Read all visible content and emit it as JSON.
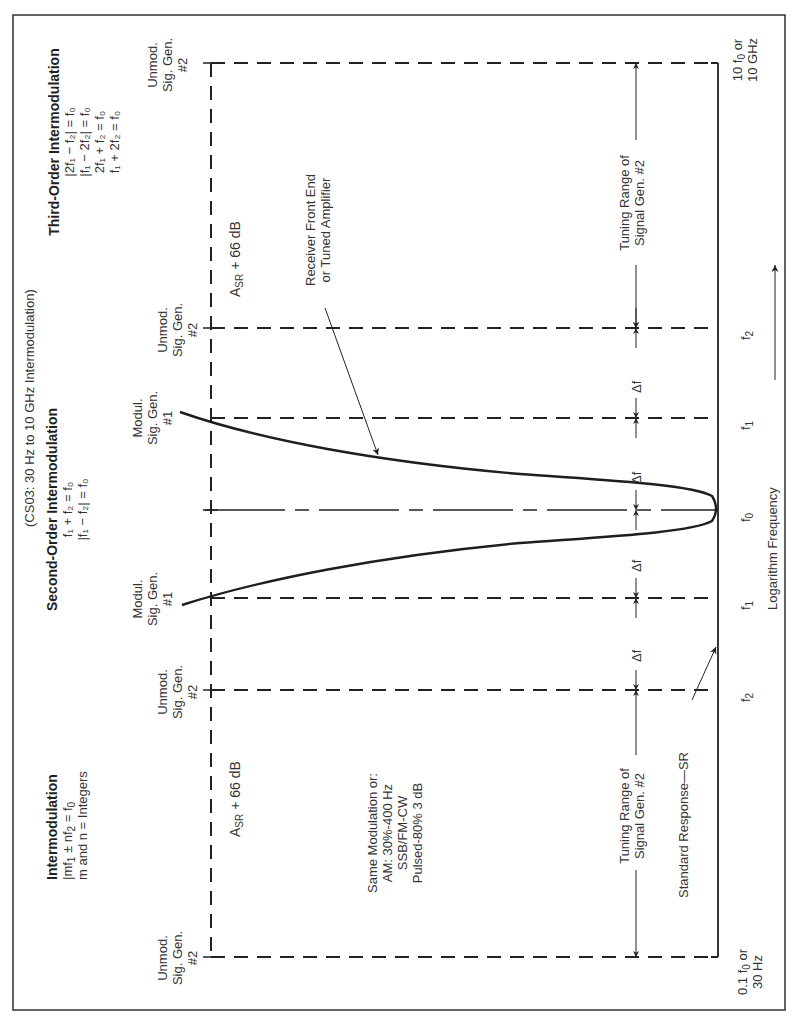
{
  "diagram": {
    "subtitle": "(CS03: 30 Hz to 10 GHz Intermodulation)",
    "intermod": {
      "title": "Intermodulation",
      "eq1": "|mf",
      "eq1_sub1": "1",
      "eq1_mid": " ± nf",
      "eq1_sub2": "2",
      "eq1_end": " = f",
      "eq1_sub3": "0",
      "note": "m and n = Integers"
    },
    "second_order": {
      "title": "Second-Order Intermodulation",
      "eq1": "f₁ + f₂ = f₀",
      "eq2": "|f₁ − f₂| = f₀"
    },
    "third_order": {
      "title": "Third-Order Intermodulation",
      "eq1": "|2f₁ − f₂| = f₀",
      "eq2": "|f₁ − 2f₂| = f₀",
      "eq3": "2f₁ + f₂ = f₀",
      "eq4": "f₁ + 2f₂ = f₀"
    },
    "signal_labels": {
      "unmod_1": "Unmod.",
      "unmod_2": "Sig. Gen.",
      "unmod_3": "#2",
      "mod_1": "Modul.",
      "mod_2": "Sig. Gen.",
      "mod_3": "#1"
    },
    "level_label": "A",
    "level_sub": "SR",
    "level_rest": " + 66 dB",
    "modulation": {
      "line1": "Same Modulation or:",
      "line2": "AM: 30%-400 Hz",
      "line3": "SSB/FM-CW",
      "line4": "Pulsed-80% 3 dB"
    },
    "receiver_label_1": "Receiver Front End",
    "receiver_label_2": "or Tuned Amplifier",
    "tuning_1": "Tuning Range of",
    "tuning_2": "Signal Gen. #2",
    "delta_f": "Δf",
    "standard_response": "Standard Response—SR",
    "axis": {
      "low_1": "0.1 f",
      "low_sub": "0",
      "low_or": " or",
      "low_2": "30 Hz",
      "high_1": "10 f",
      "high_sub": "0",
      "high_or": " or",
      "high_2": "10 GHz",
      "f2": "f",
      "f2_sub": "2",
      "f1": "f",
      "f1_sub": "1",
      "f0": "f",
      "f0_sub": "0",
      "xlabel": "Logarithm Frequency"
    }
  }
}
